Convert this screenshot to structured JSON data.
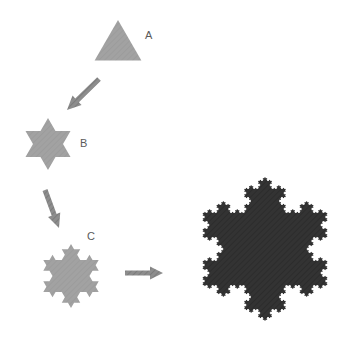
{
  "figure": {
    "background_color": "#ffffff",
    "width": 359,
    "height": 349
  },
  "palette": {
    "stage_gray": "#a2a2a2",
    "stage_gray_shade": "#9a9a9a",
    "final_dark": "#333333",
    "final_dark_shade": "#2b2b2b",
    "arrow_gray": "#8d8d8d",
    "arrow_gray_dark": "#707070",
    "label_color": "#5a5a5a"
  },
  "stages": [
    {
      "id": "stage-a",
      "label": "A",
      "label_x": 145,
      "label_y": 30,
      "iteration": 0,
      "center_x": 118,
      "center_y": 47,
      "radius": 27,
      "rotation_deg": -90,
      "fill": "#a2a2a2",
      "description": "equilateral triangle"
    },
    {
      "id": "stage-b",
      "label": "B",
      "label_x": 80,
      "label_y": 138,
      "iteration": 1,
      "center_x": 48,
      "center_y": 144,
      "radius": 26,
      "rotation_deg": -90,
      "fill": "#a2a2a2",
      "description": "six-pointed star, first Koch iteration"
    },
    {
      "id": "stage-c",
      "label": "C",
      "label_x": 87,
      "label_y": 231,
      "iteration": 2,
      "center_x": 71,
      "center_y": 276,
      "radius": 32,
      "rotation_deg": -90,
      "fill": "#a2a2a2",
      "description": "second Koch iteration, eighteen points"
    },
    {
      "id": "stage-final",
      "label": "",
      "label_x": 0,
      "label_y": 0,
      "iteration": 5,
      "center_x": 265,
      "center_y": 249,
      "radius": 72,
      "rotation_deg": -90,
      "fill": "#333333",
      "description": "Koch snowflake after many iterations"
    }
  ],
  "arrows": [
    {
      "id": "arrow-a-to-b",
      "from_stage": "A",
      "to_stage": "B",
      "x1": 99,
      "y1": 79,
      "x2": 67,
      "y2": 110,
      "thickness": 5.2,
      "head_length": 14,
      "head_width": 13,
      "fill": "#8d8d8d"
    },
    {
      "id": "arrow-b-to-c",
      "from_stage": "B",
      "to_stage": "C",
      "x1": 45,
      "y1": 190,
      "x2": 59,
      "y2": 228,
      "thickness": 5.2,
      "head_length": 14,
      "head_width": 13,
      "fill": "#8d8d8d"
    },
    {
      "id": "arrow-c-to-final",
      "from_stage": "C",
      "to_stage": "final",
      "x1": 125,
      "y1": 273,
      "x2": 163,
      "y2": 273,
      "thickness": 5.2,
      "head_length": 13,
      "head_width": 13,
      "fill": "#8d8d8d"
    }
  ],
  "chart_data": {
    "type": "diagram",
    "sequence": [
      "A",
      "B",
      "C",
      "final"
    ],
    "iterations": [
      0,
      1,
      2,
      5
    ],
    "vertex_counts": [
      3,
      12,
      48,
      3072
    ],
    "labels": [
      "A",
      "B",
      "C"
    ]
  }
}
